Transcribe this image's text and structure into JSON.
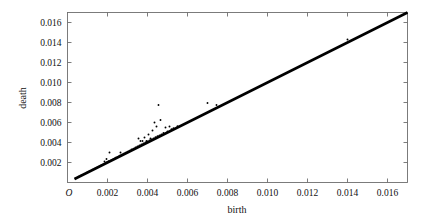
{
  "figure": {
    "background_color": "#ffffff",
    "frame_color": "#6e6e6e",
    "point_color": "#000000",
    "line_color": "#000000"
  },
  "chart_data": {
    "type": "scatter",
    "title": "",
    "xlabel": "birth",
    "ylabel": "death",
    "origin_label": "O",
    "xlim": [
      0.0,
      0.017
    ],
    "ylim": [
      0.0,
      0.017
    ],
    "grid": false,
    "legend": null,
    "xticks": [
      0.002,
      0.004,
      0.006,
      0.008,
      0.01,
      0.012,
      0.014,
      0.016
    ],
    "xticklabels": [
      "0.002",
      "0.004",
      "0.006",
      "0.008",
      "0.010",
      "0.012",
      "0.014",
      "0.016"
    ],
    "yticks": [
      0.002,
      0.004,
      0.006,
      0.008,
      0.01,
      0.012,
      0.014,
      0.016
    ],
    "yticklabels": [
      "0.002",
      "0.004",
      "0.006",
      "0.008",
      "0.010",
      "0.012",
      "0.014",
      "0.016"
    ],
    "series": [
      {
        "name": "observations",
        "marker": "point",
        "x": [
          0.0004,
          0.00055,
          0.0007,
          0.00085,
          0.001,
          0.0011,
          0.00125,
          0.0014,
          0.0015,
          0.0016,
          0.0017,
          0.0018,
          0.00185,
          0.0019,
          0.00195,
          0.00195,
          0.002,
          0.00205,
          0.0021,
          0.0022,
          0.0023,
          0.0024,
          0.0025,
          0.0026,
          0.00265,
          0.0027,
          0.0028,
          0.0029,
          0.003,
          0.0031,
          0.0032,
          0.0033,
          0.0034,
          0.0035,
          0.00355,
          0.0036,
          0.00365,
          0.0037,
          0.00375,
          0.0038,
          0.00385,
          0.0039,
          0.00395,
          0.004,
          0.00405,
          0.0041,
          0.00415,
          0.0042,
          0.00425,
          0.0043,
          0.00435,
          0.0044,
          0.00445,
          0.0045,
          0.00455,
          0.0046,
          0.00465,
          0.0047,
          0.0048,
          0.0049,
          0.005,
          0.0051,
          0.0052,
          0.0053,
          0.0055,
          0.007,
          0.00745,
          0.014
        ],
        "y": [
          0.0004,
          0.00057,
          0.00072,
          0.00086,
          0.00102,
          0.00112,
          0.00128,
          0.00143,
          0.00152,
          0.00163,
          0.00175,
          0.00184,
          0.0021,
          0.00196,
          0.002,
          0.00235,
          0.00206,
          0.00212,
          0.003,
          0.00226,
          0.00236,
          0.00247,
          0.00256,
          0.00268,
          0.003,
          0.00277,
          0.00288,
          0.00297,
          0.00309,
          0.00318,
          0.0033,
          0.00338,
          0.0035,
          0.0036,
          0.0044,
          0.0037,
          0.00415,
          0.0038,
          0.00415,
          0.0039,
          0.0045,
          0.004,
          0.00415,
          0.0041,
          0.0048,
          0.0042,
          0.0044,
          0.0043,
          0.0052,
          0.0044,
          0.006,
          0.00452,
          0.0056,
          0.00462,
          0.00775,
          0.0047,
          0.00625,
          0.0048,
          0.00495,
          0.0055,
          0.0051,
          0.0056,
          0.00532,
          0.00542,
          0.00562,
          0.00795,
          0.00775,
          0.0143
        ]
      }
    ],
    "fit_line": {
      "name": "y = x reference line",
      "x_start": 0.00035,
      "y_start": 0.00035,
      "x_end": 0.017,
      "y_end": 0.017,
      "slope": 1.0,
      "intercept": 0.0
    }
  }
}
